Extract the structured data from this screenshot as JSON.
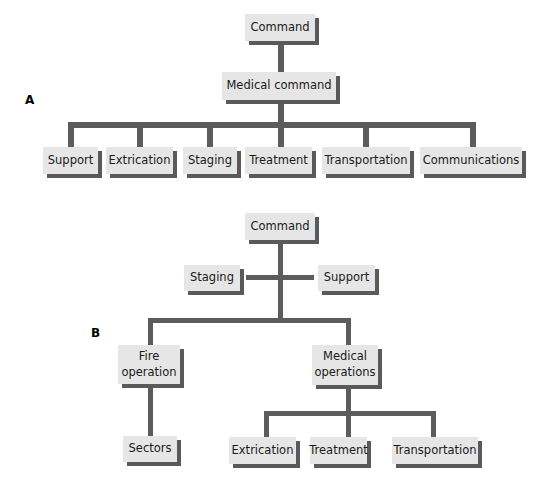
{
  "diagram": {
    "type": "organization-chart",
    "colors": {
      "node_fill": "#e6e6e6",
      "node_shadow": "#5a5a5a",
      "connector": "#5c5c5c",
      "text": "#1a1a1a"
    },
    "panel_a": {
      "label": "A",
      "root": "Command",
      "level2": "Medical command",
      "children": [
        "Support",
        "Extrication",
        "Staging",
        "Treatment",
        "Transportation",
        "Communications"
      ]
    },
    "panel_b": {
      "label": "B",
      "root": "Command",
      "staff_left": "Staging",
      "staff_right": "Support",
      "branches": [
        {
          "name": "Fire operation",
          "children": [
            "Sectors"
          ]
        },
        {
          "name": "Medical operations",
          "children": [
            "Extrication",
            "Treatment",
            "Transportation"
          ]
        }
      ],
      "fire_label_line1": "Fire",
      "fire_label_line2": "operation",
      "medical_label_line1": "Medical",
      "medical_label_line2": "operations"
    }
  }
}
